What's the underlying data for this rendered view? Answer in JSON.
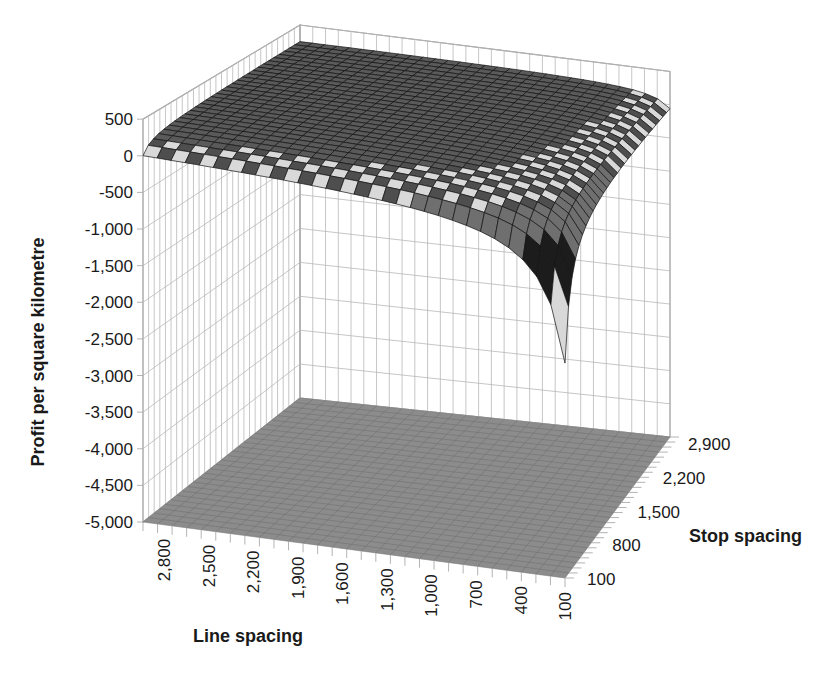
{
  "chart_data": {
    "type": "surface3d",
    "title": "",
    "zlabel": "Profit per square kilometre",
    "xlabel": "Line spacing",
    "ylabel": "Stop spacing",
    "zlim": [
      -5000,
      500
    ],
    "z_ticks": [
      "500",
      "0",
      "-500",
      "-1,000",
      "-1,500",
      "-2,000",
      "-2,500",
      "-3,000",
      "-3,500",
      "-4,000",
      "-4,500",
      "-5,000"
    ],
    "z_tick_values": [
      500,
      0,
      -500,
      -1000,
      -1500,
      -2000,
      -2500,
      -3000,
      -3500,
      -4000,
      -4500,
      -5000
    ],
    "x_ticks": [
      "2,800",
      "2,500",
      "2,200",
      "1,900",
      "1,600",
      "1,300",
      "1,000",
      "700",
      "400",
      "100"
    ],
    "y_ticks": [
      "100",
      "800",
      "1,500",
      "2,200",
      "2,900"
    ],
    "x_range": [
      100,
      3000
    ],
    "y_range": [
      100,
      3000
    ],
    "grid": true,
    "floor_color": "#8c8c8c",
    "band_colors": [
      "#1c1c1c",
      "#d8d8d8",
      "#6e6e6e",
      "#a8a8a8",
      "#3a3a3a",
      "#f0f0f0",
      "#7a7a7a"
    ],
    "surface_description": "Surface is near 0 to ~250 across most of the grid (plateau), dropping sharply toward -5,000 as both line spacing and stop spacing approach 100.",
    "sample_points": [
      {
        "line_spacing": 2800,
        "stop_spacing": 2900,
        "profit": 250
      },
      {
        "line_spacing": 1600,
        "stop_spacing": 1500,
        "profit": 200
      },
      {
        "line_spacing": 2800,
        "stop_spacing": 100,
        "profit": 0
      },
      {
        "line_spacing": 700,
        "stop_spacing": 2900,
        "profit": 0
      },
      {
        "line_spacing": 400,
        "stop_spacing": 800,
        "profit": -700
      },
      {
        "line_spacing": 100,
        "stop_spacing": 800,
        "profit": -1200
      },
      {
        "line_spacing": 100,
        "stop_spacing": 400,
        "profit": -2500
      },
      {
        "line_spacing": 100,
        "stop_spacing": 100,
        "profit": -5000
      }
    ]
  }
}
